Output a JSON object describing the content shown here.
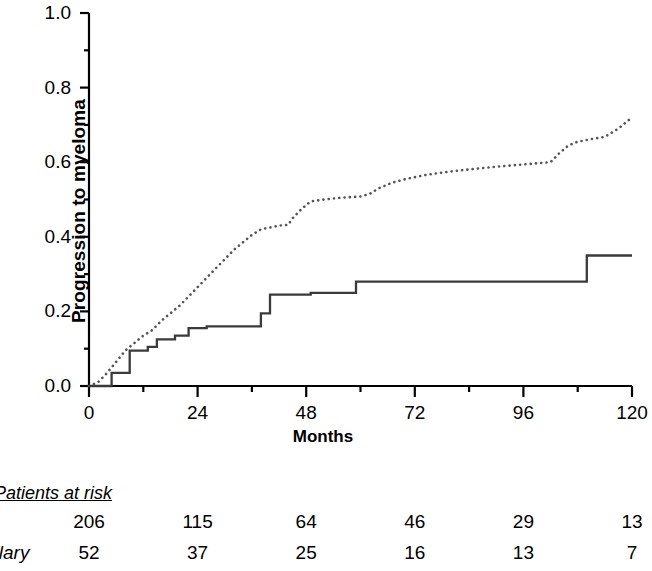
{
  "chart_data": {
    "type": "line",
    "title": "",
    "xlabel": "Months",
    "ylabel": "Progression to myeloma",
    "xlim": [
      0,
      120
    ],
    "ylim": [
      0.0,
      1.0
    ],
    "xticks": [
      0,
      24,
      48,
      72,
      96,
      120
    ],
    "xtick_labels": [
      "0",
      "24",
      "48",
      "72",
      "96",
      "120"
    ],
    "x_minor_tick_interval": 12,
    "yticks": [
      0.0,
      0.2,
      0.4,
      0.6,
      0.8,
      1.0
    ],
    "ytick_labels": [
      "0.0",
      "0.2",
      "0.4",
      "0.6",
      "0.8",
      "1.0"
    ],
    "y_minor_tick_interval": 0.1,
    "grid": false,
    "legend": "none",
    "series": [
      {
        "name": "dotted-curve",
        "style": "dotted",
        "color": "#555555",
        "points": [
          [
            0,
            0.0
          ],
          [
            2,
            0.01
          ],
          [
            4,
            0.035
          ],
          [
            6,
            0.065
          ],
          [
            8,
            0.095
          ],
          [
            10,
            0.115
          ],
          [
            12,
            0.135
          ],
          [
            14,
            0.15
          ],
          [
            16,
            0.175
          ],
          [
            18,
            0.195
          ],
          [
            20,
            0.215
          ],
          [
            22,
            0.24
          ],
          [
            24,
            0.265
          ],
          [
            26,
            0.29
          ],
          [
            28,
            0.315
          ],
          [
            30,
            0.34
          ],
          [
            32,
            0.365
          ],
          [
            34,
            0.385
          ],
          [
            36,
            0.405
          ],
          [
            38,
            0.42
          ],
          [
            40,
            0.425
          ],
          [
            42,
            0.43
          ],
          [
            44,
            0.432
          ],
          [
            45,
            0.45
          ],
          [
            47,
            0.475
          ],
          [
            49,
            0.495
          ],
          [
            52,
            0.5
          ],
          [
            56,
            0.505
          ],
          [
            60,
            0.508
          ],
          [
            62,
            0.515
          ],
          [
            64,
            0.53
          ],
          [
            67,
            0.545
          ],
          [
            70,
            0.555
          ],
          [
            74,
            0.565
          ],
          [
            78,
            0.572
          ],
          [
            82,
            0.578
          ],
          [
            86,
            0.583
          ],
          [
            90,
            0.588
          ],
          [
            94,
            0.592
          ],
          [
            98,
            0.596
          ],
          [
            102,
            0.6
          ],
          [
            104,
            0.625
          ],
          [
            106,
            0.645
          ],
          [
            108,
            0.655
          ],
          [
            111,
            0.662
          ],
          [
            114,
            0.668
          ],
          [
            117,
            0.69
          ],
          [
            120,
            0.72
          ]
        ]
      },
      {
        "name": "solid-step-curve",
        "style": "step",
        "color": "#3a3a3a",
        "points": [
          [
            0,
            0.0
          ],
          [
            5,
            0.0
          ],
          [
            5,
            0.035
          ],
          [
            9,
            0.035
          ],
          [
            9,
            0.095
          ],
          [
            13,
            0.095
          ],
          [
            13,
            0.105
          ],
          [
            15,
            0.105
          ],
          [
            15,
            0.125
          ],
          [
            19,
            0.125
          ],
          [
            19,
            0.135
          ],
          [
            22,
            0.135
          ],
          [
            22,
            0.155
          ],
          [
            26,
            0.155
          ],
          [
            26,
            0.16
          ],
          [
            38,
            0.16
          ],
          [
            38,
            0.195
          ],
          [
            40,
            0.195
          ],
          [
            40,
            0.245
          ],
          [
            49,
            0.245
          ],
          [
            49,
            0.25
          ],
          [
            59,
            0.25
          ],
          [
            59,
            0.28
          ],
          [
            110,
            0.28
          ],
          [
            110,
            0.35
          ],
          [
            120,
            0.35
          ]
        ]
      }
    ]
  },
  "risk_table": {
    "caption": "Patients at risk",
    "columns": [
      "0",
      "24",
      "48",
      "72",
      "96",
      "120"
    ],
    "rows": [
      {
        "label": "",
        "values": [
          "206",
          "115",
          "64",
          "46",
          "29",
          "13"
        ]
      },
      {
        "label": "ullary",
        "values": [
          "52",
          "37",
          "25",
          "16",
          "13",
          "7"
        ]
      }
    ]
  }
}
